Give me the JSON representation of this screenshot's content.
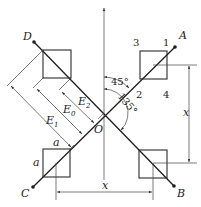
{
  "diagram": {
    "title": "",
    "points": {
      "A": "A",
      "B": "B",
      "C": "C",
      "D": "D",
      "O": "O"
    },
    "corner_numbers": {
      "n1": "1",
      "n2": "2",
      "n3": "3",
      "n4": "4"
    },
    "angles": {
      "a45": "45°",
      "a135": "135°"
    },
    "dimensions": {
      "E1": "E",
      "E1_sub": "1",
      "E0": "E",
      "E0_sub": "0",
      "E2": "E",
      "E2_sub": "2",
      "x_horizontal": "x",
      "x_vertical": "x",
      "a_top": "a",
      "a_left": "a"
    },
    "colors": {
      "line": "#2a2a2a",
      "background": "#ffffff"
    }
  }
}
